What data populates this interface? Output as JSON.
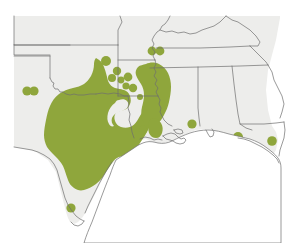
{
  "figure": {
    "region_label": "South-central United States",
    "width": 290,
    "height": 243
  },
  "colors": {
    "range_fill": "#8fa63c",
    "dot_fill": "#8fa63c",
    "land_fill": "#ededeb",
    "water_fill": "#ffffff",
    "border_stroke": "#6e6e6e",
    "page_background": "#ffffff"
  },
  "legend": {
    "range_label": "Continuous range",
    "dot_label": "Isolated occurrence record"
  },
  "map_data": {
    "type": "range-map",
    "projection_note": "unlabeled equirectangular-style outline",
    "states_shown": [
      "Colorado",
      "Kansas",
      "Missouri",
      "Illinois",
      "Kentucky",
      "Tennessee",
      "New Mexico",
      "Oklahoma",
      "Arkansas",
      "Mississippi",
      "Alabama",
      "Georgia",
      "Texas",
      "Louisiana",
      "Florida"
    ],
    "range_polygon_count": 2,
    "occurrence_dot_count": 18,
    "occurrence_dots": [
      {
        "id": "dot-01",
        "x": 27,
        "y": 91,
        "r": 4.6,
        "area": "west Texas / New Mexico border"
      },
      {
        "id": "dot-02",
        "x": 34,
        "y": 91,
        "r": 4.6,
        "area": "west Texas / New Mexico border"
      },
      {
        "id": "dot-03",
        "x": 106,
        "y": 61,
        "r": 5.0,
        "area": "northeast Oklahoma"
      },
      {
        "id": "dot-04",
        "x": 117,
        "y": 71,
        "r": 4.2,
        "area": "northwest Arkansas"
      },
      {
        "id": "dot-05",
        "x": 112,
        "y": 78,
        "r": 4.0,
        "area": "northwest Arkansas"
      },
      {
        "id": "dot-06",
        "x": 121,
        "y": 80,
        "r": 3.4,
        "area": "north-central Arkansas"
      },
      {
        "id": "dot-07",
        "x": 128,
        "y": 77,
        "r": 4.4,
        "area": "north-central Arkansas"
      },
      {
        "id": "dot-08",
        "x": 126,
        "y": 86,
        "r": 3.6,
        "area": "central Arkansas"
      },
      {
        "id": "dot-09",
        "x": 133,
        "y": 88,
        "r": 4.2,
        "area": "central Arkansas"
      },
      {
        "id": "dot-10",
        "x": 152,
        "y": 51,
        "r": 4.4,
        "area": "southeast Missouri"
      },
      {
        "id": "dot-11",
        "x": 160,
        "y": 51,
        "r": 4.4,
        "area": "southern Illinois"
      },
      {
        "id": "dot-12",
        "x": 143,
        "y": 130,
        "r": 4.4,
        "area": "central Louisiana"
      },
      {
        "id": "dot-13",
        "x": 192,
        "y": 124,
        "r": 4.6,
        "area": "southern Mississippi"
      },
      {
        "id": "dot-14",
        "x": 238,
        "y": 137,
        "r": 5.0,
        "area": "Florida panhandle west"
      },
      {
        "id": "dot-15",
        "x": 272,
        "y": 141,
        "r": 4.8,
        "area": "Florida panhandle east"
      },
      {
        "id": "dot-16",
        "x": 71,
        "y": 208,
        "r": 4.6,
        "area": "south Texas"
      },
      {
        "id": "dot-17",
        "x": 140,
        "y": 97,
        "r": 3.0,
        "area": "southeast Arkansas"
      },
      {
        "id": "dot-18",
        "x": 120,
        "y": 92,
        "r": 2.8,
        "area": "central Arkansas"
      }
    ]
  }
}
